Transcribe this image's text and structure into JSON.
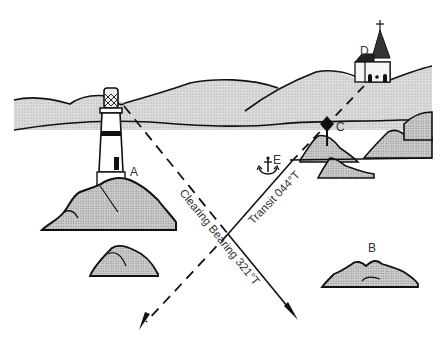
{
  "diagram": {
    "labels": {
      "A": "A",
      "B": "B",
      "C": "C",
      "D": "D",
      "E": "E"
    },
    "lines": {
      "clearing_bearing": "Clearing Bearing 321°T",
      "transit": "Transit 044°T"
    },
    "features": [
      {
        "id": "A",
        "name": "lighthouse on rocks"
      },
      {
        "id": "B",
        "name": "rock"
      },
      {
        "id": "C",
        "name": "beacon with diamond topmark on rocks"
      },
      {
        "id": "D",
        "name": "church with spire"
      },
      {
        "id": "E",
        "name": "anchorage"
      }
    ],
    "colors": {
      "ink": "#111111",
      "land_fill": "#d6d6d6",
      "rock_fill": "#c9c9c9",
      "background": "#ffffff"
    }
  }
}
